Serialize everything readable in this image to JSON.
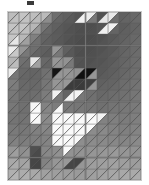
{
  "image": {
    "title": "Triangulated grayscale mosaic of a cat face",
    "width_px": 149,
    "height_px": 185,
    "background_color": "#ffffff",
    "top_mark_color": "#3a3a3a",
    "grid_border_color": "#c9c9c9",
    "diagonal_line_color": "#4a4a4a",
    "cell_border_color": "#5a5a5a"
  },
  "grid": {
    "left_px": 7,
    "top_px": 11,
    "width_px": 135,
    "height_px": 170,
    "columns": 12,
    "rows": 15,
    "split": "anti-diagonal",
    "note": "Each cell is divided by a diagonal from top-right to bottom-left into an upper-left triangle and a lower-right triangle, each filled with its own gray level."
  },
  "chart_data": {
    "type": "heatmap",
    "xlabel": "",
    "ylabel": "",
    "columns": 12,
    "rows": 15,
    "value_range": [
      0,
      255
    ],
    "colormap": "grayscale",
    "upper_values": [
      [
        188,
        196,
        190,
        186,
        110,
        96,
        84,
        236,
        82,
        232,
        96,
        104
      ],
      [
        196,
        198,
        182,
        120,
        96,
        86,
        80,
        78,
        84,
        240,
        92,
        100
      ],
      [
        198,
        184,
        128,
        100,
        92,
        84,
        78,
        76,
        80,
        88,
        96,
        104
      ],
      [
        236,
        150,
        110,
        96,
        150,
        96,
        80,
        78,
        82,
        88,
        98,
        106
      ],
      [
        180,
        112,
        230,
        104,
        150,
        146,
        84,
        80,
        84,
        90,
        100,
        108
      ],
      [
        238,
        104,
        100,
        112,
        20,
        150,
        146,
        18,
        88,
        94,
        102,
        110
      ],
      [
        126,
        104,
        104,
        118,
        150,
        152,
        60,
        62,
        96,
        100,
        108,
        114
      ],
      [
        122,
        110,
        110,
        124,
        240,
        100,
        244,
        110,
        104,
        108,
        112,
        118
      ],
      [
        120,
        112,
        246,
        130,
        124,
        120,
        118,
        116,
        112,
        116,
        118,
        122
      ],
      [
        118,
        114,
        250,
        140,
        248,
        250,
        250,
        250,
        244,
        126,
        122,
        126
      ],
      [
        120,
        118,
        132,
        136,
        250,
        250,
        250,
        250,
        134,
        130,
        126,
        130
      ],
      [
        124,
        122,
        126,
        130,
        250,
        250,
        248,
        138,
        136,
        134,
        132,
        136
      ],
      [
        150,
        140,
        80,
        134,
        142,
        250,
        144,
        146,
        148,
        150,
        148,
        146
      ],
      [
        168,
        162,
        70,
        130,
        150,
        152,
        68,
        156,
        158,
        160,
        158,
        156
      ],
      [
        176,
        172,
        168,
        160,
        158,
        156,
        154,
        158,
        162,
        166,
        168,
        170
      ]
    ],
    "lower_values": [
      [
        192,
        194,
        186,
        140,
        100,
        90,
        240,
        120,
        230,
        110,
        100,
        106
      ],
      [
        194,
        190,
        150,
        104,
        90,
        82,
        78,
        80,
        240,
        100,
        96,
        102
      ],
      [
        230,
        160,
        112,
        96,
        88,
        80,
        76,
        78,
        84,
        92,
        100,
        106
      ],
      [
        200,
        120,
        100,
        92,
        120,
        88,
        78,
        80,
        86,
        94,
        102,
        108
      ],
      [
        188,
        108,
        160,
        100,
        146,
        120,
        82,
        84,
        88,
        96,
        104,
        110
      ],
      [
        118,
        102,
        102,
        116,
        150,
        148,
        16,
        150,
        92,
        98,
        106,
        112
      ],
      [
        124,
        106,
        106,
        120,
        148,
        60,
        58,
        150,
        100,
        104,
        110,
        116
      ],
      [
        120,
        108,
        112,
        126,
        120,
        244,
        120,
        112,
        106,
        110,
        114,
        120
      ],
      [
        118,
        112,
        250,
        134,
        248,
        122,
        120,
        118,
        114,
        118,
        120,
        124
      ],
      [
        116,
        116,
        248,
        138,
        250,
        250,
        250,
        250,
        130,
        128,
        124,
        128
      ],
      [
        122,
        120,
        128,
        132,
        250,
        250,
        250,
        140,
        138,
        132,
        128,
        132
      ],
      [
        130,
        126,
        128,
        132,
        250,
        248,
        142,
        140,
        138,
        136,
        134,
        138
      ],
      [
        158,
        146,
        74,
        136,
        146,
        146,
        148,
        150,
        152,
        154,
        150,
        148
      ],
      [
        172,
        166,
        68,
        138,
        152,
        70,
        150,
        158,
        160,
        162,
        160,
        158
      ],
      [
        180,
        176,
        170,
        162,
        160,
        158,
        156,
        160,
        164,
        168,
        170,
        172
      ]
    ]
  }
}
